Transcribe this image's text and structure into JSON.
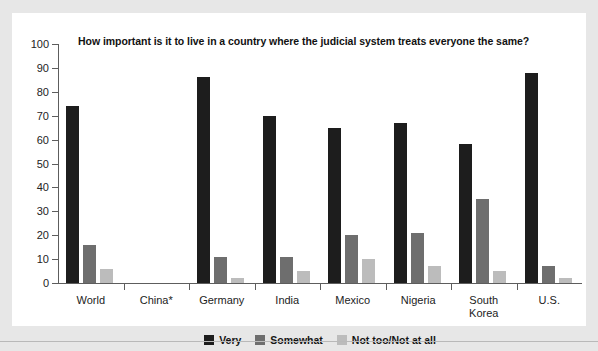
{
  "chart_data": {
    "type": "bar",
    "title": "How important is it to live in a country where the judicial system treats everyone the same?",
    "xlabel": "",
    "ylabel": "",
    "ylim": [
      0,
      100
    ],
    "yticks": [
      0,
      10,
      20,
      30,
      40,
      50,
      60,
      70,
      80,
      90,
      100
    ],
    "grid": false,
    "legend_position": "bottom-center",
    "categories": [
      "World",
      "China*",
      "Germany",
      "India",
      "Mexico",
      "Nigeria",
      "South\nKorea",
      "U.S."
    ],
    "series": [
      {
        "name": "Very",
        "color": "#1d1d1d",
        "values": [
          74,
          null,
          86,
          70,
          65,
          67,
          58,
          88
        ]
      },
      {
        "name": "Somewhat",
        "color": "#6e6e6e",
        "values": [
          16,
          null,
          11,
          11,
          20,
          21,
          35,
          7
        ]
      },
      {
        "name": "Not too/Not at all",
        "color": "#bcbcbc",
        "values": [
          6,
          null,
          2,
          5,
          10,
          7,
          5,
          2
        ]
      }
    ]
  },
  "colors": {
    "very": "#1d1d1d",
    "somewhat": "#6e6e6e",
    "not_too": "#bcbcbc",
    "axis": "#5d5d5d",
    "panel_background": "#ffffff",
    "figure_background": "#e7e7e7"
  }
}
